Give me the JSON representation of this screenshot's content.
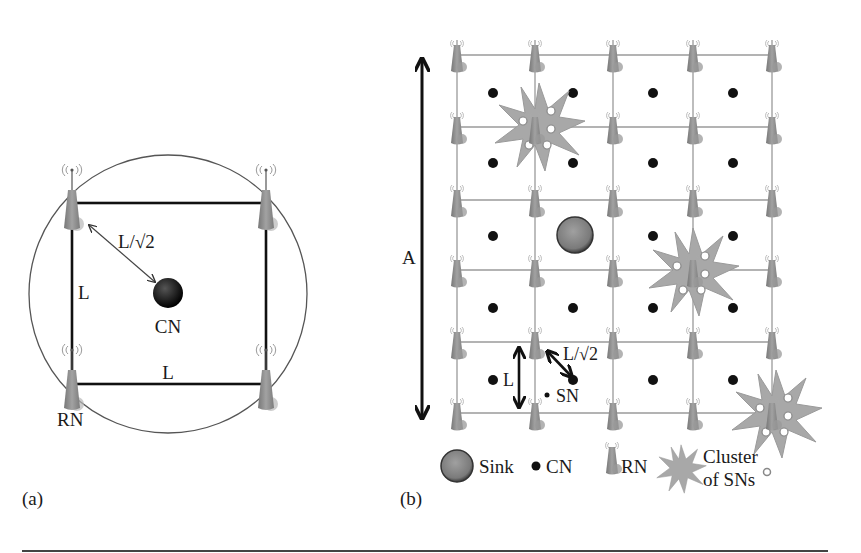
{
  "panel_a": {
    "caption": "(a)",
    "side_label_vertical": "L",
    "side_label_horizontal": "L",
    "diag_label": "L/√2",
    "center_node_label": "CN",
    "corner_node_label": "RN"
  },
  "panel_b": {
    "caption": "(b)",
    "area_label": "A",
    "spacing_label": "L",
    "diag_label": "L/√2",
    "sensor_label": "SN",
    "grid": {
      "columns_x": [
        457,
        535,
        613,
        693,
        772
      ],
      "rows_y": [
        55,
        127,
        200,
        270,
        342,
        413
      ]
    },
    "cn_positions": [
      [
        493,
        93
      ],
      [
        573,
        93
      ],
      [
        653,
        93
      ],
      [
        733,
        93
      ],
      [
        493,
        163
      ],
      [
        573,
        163
      ],
      [
        653,
        163
      ],
      [
        733,
        163
      ],
      [
        493,
        236
      ],
      [
        653,
        236
      ],
      [
        733,
        236
      ],
      [
        493,
        308
      ],
      [
        573,
        308
      ],
      [
        653,
        308
      ],
      [
        733,
        308
      ],
      [
        493,
        380
      ],
      [
        653,
        380
      ],
      [
        733,
        380
      ]
    ],
    "sink_position": [
      575,
      235
    ],
    "clusters": [
      [
        537,
        127
      ],
      [
        693,
        270
      ],
      [
        772,
        413
      ]
    ],
    "legend": {
      "sink": "Sink",
      "cn": "CN",
      "rn": "RN",
      "cluster_line1": "Cluster",
      "cluster_line2": "of SNs"
    }
  },
  "colors": {
    "rn_gray": "#8e8e8e",
    "grid_line": "#9a9a9a",
    "cluster_fill": "#a9a9a9",
    "sink_fill": "#7d7d7d",
    "cn_black": "#111111"
  }
}
